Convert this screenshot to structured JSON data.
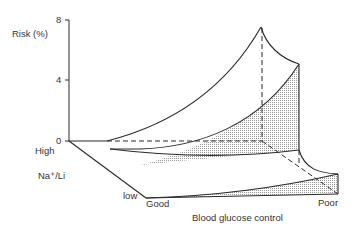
{
  "figure": {
    "y_axis_label": "Risk (%)",
    "y_ticks": [
      "8",
      "4",
      "0"
    ],
    "depth_axis_label": "Na⁺/Li",
    "depth_high": "High",
    "depth_low": "low",
    "x_axis_label": "Blood glucose control",
    "x_good": "Good",
    "x_poor": "Poor"
  },
  "colors": {
    "line": "#2a2a2a",
    "shade": "#cfcfcf"
  }
}
